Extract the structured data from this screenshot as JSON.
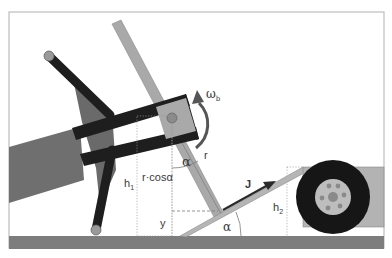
{
  "diagram": {
    "labels": {
      "omega": "ω",
      "omega_sub": "b",
      "alpha_top": "α",
      "alpha_bottom": "α",
      "r": "r",
      "r_cos": "r·cosα",
      "h1": "h",
      "h1_sub": "1",
      "h2": "h",
      "h2_sub": "2",
      "y": "y",
      "J": "J"
    },
    "colors": {
      "frame": "#bdbdbd",
      "ground": "#7d7d7d",
      "bar_black": "#1e1e1e",
      "lever_gray": "#a9a9a9",
      "body_gray": "#6f6f6f",
      "ramp_gray": "#b5b5b5",
      "tire": "#161616",
      "hub": "#bdbdbd",
      "dashed": "#9a9a9a"
    }
  }
}
